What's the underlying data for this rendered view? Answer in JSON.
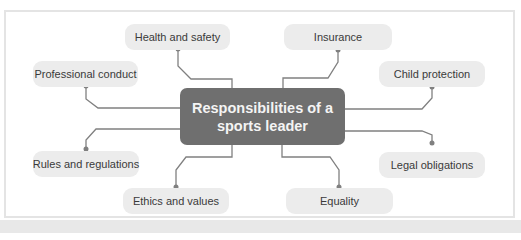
{
  "diagram": {
    "center": {
      "line1": "Responsibilities of a",
      "line2": "sports leader"
    },
    "nodes": [
      {
        "id": "health",
        "label": "Health and safety"
      },
      {
        "id": "insurance",
        "label": "Insurance"
      },
      {
        "id": "professional",
        "label": "Professional conduct"
      },
      {
        "id": "child",
        "label": "Child protection"
      },
      {
        "id": "rules",
        "label": "Rules and regulations"
      },
      {
        "id": "legal",
        "label": "Legal obligations"
      },
      {
        "id": "ethics",
        "label": "Ethics and values"
      },
      {
        "id": "equality",
        "label": "Equality"
      }
    ],
    "colors": {
      "center_fill": "#6f6f6f",
      "node_fill": "#ececec",
      "line": "#808080"
    }
  }
}
